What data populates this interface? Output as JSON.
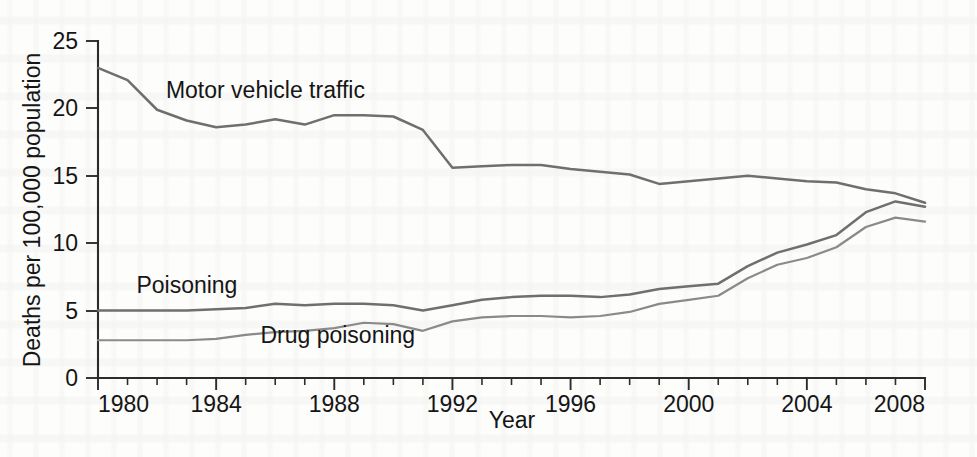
{
  "chart_data": {
    "type": "line",
    "title": "",
    "xlabel": "Year",
    "ylabel": "Deaths per 100,000 population",
    "xlim": [
      1980,
      2008
    ],
    "ylim": [
      0,
      25
    ],
    "yticks": [
      "0",
      "5",
      "10",
      "15",
      "20",
      "25"
    ],
    "ytick_values": [
      0,
      5,
      10,
      15,
      20,
      25
    ],
    "xticks": [
      "1980",
      "1984",
      "1988",
      "1992",
      "1996",
      "2000",
      "2004",
      "2008"
    ],
    "xtick_values": [
      1980,
      1984,
      1988,
      1992,
      1996,
      2000,
      2004,
      2008
    ],
    "xtick_minor_interval": 1,
    "grid": false,
    "legend": "inline-labels",
    "x": [
      1980,
      1981,
      1982,
      1983,
      1984,
      1985,
      1986,
      1987,
      1988,
      1989,
      1990,
      1991,
      1992,
      1993,
      1994,
      1995,
      1996,
      1997,
      1998,
      1999,
      2000,
      2001,
      2002,
      2003,
      2004,
      2005,
      2006,
      2007,
      2008
    ],
    "series": [
      {
        "name": "Motor vehicle traffic",
        "color": "#6f6f6f",
        "values": [
          23.0,
          22.1,
          19.9,
          19.1,
          18.6,
          18.8,
          19.2,
          18.8,
          19.5,
          19.5,
          19.4,
          18.4,
          15.6,
          15.7,
          15.8,
          15.8,
          15.5,
          15.3,
          15.1,
          14.4,
          14.6,
          14.8,
          15.0,
          14.8,
          14.6,
          14.5,
          14.0,
          13.7,
          13.0
        ]
      },
      {
        "name": "Poisoning",
        "color": "#6f6f6f",
        "values": [
          5.0,
          5.0,
          5.0,
          5.0,
          5.1,
          5.2,
          5.5,
          5.4,
          5.5,
          5.5,
          5.4,
          5.0,
          5.4,
          5.8,
          6.0,
          6.1,
          6.1,
          6.0,
          6.2,
          6.6,
          6.8,
          7.0,
          8.3,
          9.3,
          9.9,
          10.6,
          12.3,
          13.1,
          12.7
        ]
      },
      {
        "name": "Drug poisoning",
        "color": "#8a8a8a",
        "values": [
          2.8,
          2.8,
          2.8,
          2.8,
          2.9,
          3.2,
          3.4,
          3.5,
          3.7,
          4.1,
          4.0,
          3.5,
          4.2,
          4.5,
          4.6,
          4.6,
          4.5,
          4.6,
          4.9,
          5.5,
          5.8,
          6.1,
          7.4,
          8.4,
          8.9,
          9.7,
          11.2,
          11.9,
          11.6
        ]
      }
    ],
    "annotations": [
      {
        "text": "Motor vehicle traffic",
        "x": 1982.3,
        "y": 20.8
      },
      {
        "text": "Poisoning",
        "x": 1981.3,
        "y": 6.3
      },
      {
        "text": "Drug poisoning",
        "x": 1985.5,
        "y": 2.6
      }
    ]
  }
}
